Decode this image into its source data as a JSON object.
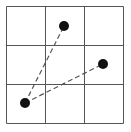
{
  "diagram": {
    "type": "grid-with-points",
    "grid": {
      "rows": 3,
      "cols": 3,
      "x0": 6.5,
      "y0": 6.5,
      "cell": 39,
      "line_color": "#555555",
      "line_width": 1
    },
    "points": [
      {
        "id": "p1",
        "x": 64,
        "y": 26,
        "r": 5,
        "color": "#111111"
      },
      {
        "id": "p2",
        "x": 103,
        "y": 64,
        "r": 5,
        "color": "#111111"
      },
      {
        "id": "p3",
        "x": 25,
        "y": 103,
        "r": 5,
        "color": "#111111"
      }
    ],
    "segments": [
      {
        "from": "p3",
        "to": "p1",
        "style": "dashed",
        "color": "#555555"
      },
      {
        "from": "p3",
        "to": "p2",
        "style": "dashed",
        "color": "#555555"
      }
    ]
  }
}
